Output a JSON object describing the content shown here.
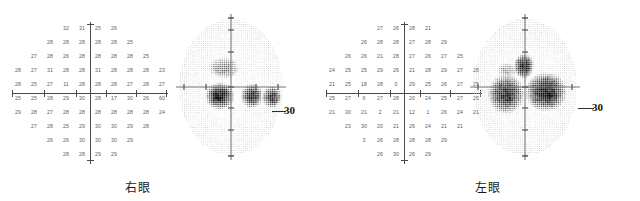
{
  "document": {
    "type": "visual-field-test-report",
    "background_color": "#ffffff",
    "eye_count": 2
  },
  "panels": [
    {
      "id": "right-eye",
      "caption": "右眼",
      "scale_label": "30",
      "numeric_grid": {
        "columns": 10,
        "rows": [
          [
            "",
            "",
            "",
            "32",
            "31",
            "25",
            "26",
            "",
            "",
            ""
          ],
          [
            "",
            "",
            "28",
            "28",
            "28",
            "28",
            "28",
            "25",
            "",
            ""
          ],
          [
            "",
            "27",
            "28",
            "26",
            "28",
            "28",
            "28",
            "28",
            "25",
            ""
          ],
          [
            "28",
            "27",
            "31",
            "28",
            "28",
            "31",
            "28",
            "28",
            "28",
            "23"
          ],
          [
            "28",
            "25",
            "27",
            "11",
            "28",
            "28",
            "28",
            "27",
            "28",
            "27"
          ],
          [
            "25",
            "25",
            "28",
            "29",
            "30",
            "28",
            "17",
            "30",
            "26",
            "60"
          ],
          [
            "29",
            "28",
            "27",
            "28",
            "28",
            "28",
            "28",
            "28",
            "28",
            "24"
          ],
          [
            "",
            "27",
            "28",
            "25",
            "29",
            "30",
            "30",
            "29",
            "28",
            ""
          ],
          [
            "",
            "",
            "26",
            "26",
            "30",
            "30",
            "30",
            "29",
            "",
            ""
          ],
          [
            "",
            "",
            "",
            "28",
            "28",
            "29",
            "29",
            "",
            "",
            ""
          ]
        ]
      },
      "grayscale": {
        "description": "stippled-threshold-map",
        "defects": [
          {
            "name": "superior-paracentral-blob",
            "cx": 52,
            "cy": 56,
            "rx": 13,
            "ry": 9,
            "darkness": 0.62
          },
          {
            "name": "inferior-nasal-dense-block",
            "cx": 48,
            "cy": 84,
            "rx": 12,
            "ry": 11,
            "darkness": 0.95
          },
          {
            "name": "inferior-temporal-block-a",
            "cx": 80,
            "cy": 84,
            "rx": 9,
            "ry": 10,
            "darkness": 0.9
          },
          {
            "name": "inferior-temporal-block-b",
            "cx": 100,
            "cy": 85,
            "rx": 8,
            "ry": 9,
            "darkness": 0.88
          }
        ]
      }
    },
    {
      "id": "left-eye",
      "caption": "左眼",
      "scale_label": "30",
      "numeric_grid": {
        "columns": 10,
        "rows": [
          [
            "",
            "",
            "",
            "27",
            "26",
            "28",
            "21",
            "",
            "",
            ""
          ],
          [
            "",
            "",
            "26",
            "28",
            "28",
            "27",
            "28",
            "29",
            "",
            ""
          ],
          [
            "",
            "26",
            "26",
            "21",
            "28",
            "27",
            "26",
            "27",
            "25",
            ""
          ],
          [
            "24",
            "25",
            "25",
            "29",
            "26",
            "21",
            "28",
            "29",
            "27",
            "28"
          ],
          [
            "21",
            "25",
            "18",
            "28",
            "0",
            "29",
            "25",
            "26",
            "27",
            "25"
          ],
          [
            "25",
            "27",
            "6",
            "27",
            "28",
            "20",
            "24",
            "25",
            "27",
            "25"
          ],
          [
            "21",
            "30",
            "21",
            "2",
            "21",
            "12",
            "1",
            "26",
            "24",
            "21"
          ],
          [
            "",
            "23",
            "30",
            "20",
            "21",
            "26",
            "24",
            "21",
            "21",
            ""
          ],
          [
            "",
            "",
            "3",
            "26",
            "28",
            "28",
            "28",
            "29",
            "",
            ""
          ],
          [
            "",
            "",
            "",
            "26",
            "30",
            "26",
            "29",
            "",
            "",
            ""
          ]
        ]
      },
      "grayscale": {
        "description": "stippled-threshold-map",
        "defects": [
          {
            "name": "superior-nasal-step",
            "cx": 41,
            "cy": 58,
            "rx": 9,
            "ry": 6,
            "darkness": 0.55
          },
          {
            "name": "superior-central-dense-block",
            "cx": 58,
            "cy": 54,
            "rx": 8,
            "ry": 10,
            "darkness": 0.96
          },
          {
            "name": "inferior-nasal-arcuate",
            "cx": 40,
            "cy": 82,
            "rx": 15,
            "ry": 16,
            "darkness": 0.9
          },
          {
            "name": "inferior-temporal-arcuate",
            "cx": 80,
            "cy": 80,
            "rx": 17,
            "ry": 16,
            "darkness": 0.95
          }
        ]
      }
    }
  ]
}
